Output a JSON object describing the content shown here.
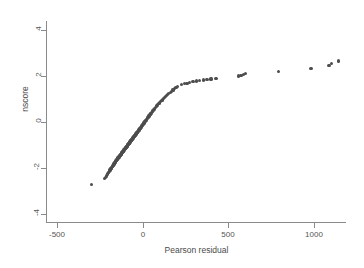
{
  "chart_data": {
    "type": "scatter",
    "title": "",
    "xlabel": "Pearson residual",
    "ylabel": "nscore",
    "xlim": [
      -560,
      1190
    ],
    "ylim": [
      -4.35,
      4.35
    ],
    "xticks": [
      -500,
      0,
      500,
      1000
    ],
    "xticklabels": [
      "-500",
      "0",
      "500",
      "1000"
    ],
    "yticks": [
      -4,
      -2,
      0,
      2,
      4
    ],
    "yticklabels": [
      "-4",
      "-2",
      "0",
      "2",
      "4"
    ],
    "grid": false,
    "legend": null,
    "marker": {
      "color": "#4d4d4d",
      "size": 3.2,
      "shape": "circle"
    },
    "series": [
      {
        "name": "nscore vs Pearson residual",
        "x": [
          -300,
          -222,
          -218,
          -214,
          -210,
          -207,
          -204,
          -201,
          -198,
          -196,
          -193,
          -191,
          -189,
          -187,
          -185,
          -183,
          -181,
          -179,
          -177,
          -175,
          -173,
          -171,
          -170,
          -168,
          -166,
          -165,
          -163,
          -162,
          -160,
          -159,
          -157,
          -156,
          -154,
          -153,
          -151,
          -150,
          -148,
          -147,
          -145,
          -144,
          -143,
          -141,
          -140,
          -139,
          -137,
          -136,
          -135,
          -133,
          -132,
          -131,
          -130,
          -128,
          -127,
          -126,
          -125,
          -123,
          -122,
          -121,
          -120,
          -119,
          -117,
          -116,
          -115,
          -114,
          -113,
          -112,
          -110,
          -109,
          -108,
          -107,
          -106,
          -105,
          -104,
          -102,
          -101,
          -100,
          -99,
          -98,
          -97,
          -96,
          -95,
          -93,
          -92,
          -91,
          -90,
          -89,
          -88,
          -87,
          -86,
          -85,
          -84,
          -82,
          -81,
          -80,
          -79,
          -78,
          -77,
          -76,
          -75,
          -74,
          -73,
          -71,
          -70,
          -69,
          -68,
          -67,
          -66,
          -65,
          -64,
          -63,
          -61,
          -60,
          -59,
          -58,
          -57,
          -56,
          -55,
          -53,
          -52,
          -51,
          -50,
          -49,
          -47,
          -46,
          -45,
          -44,
          -42,
          -41,
          -40,
          -39,
          -37,
          -36,
          -35,
          -33,
          -32,
          -31,
          -29,
          -28,
          -26,
          -25,
          -23,
          -22,
          -20,
          -19,
          -17,
          -16,
          -14,
          -12,
          -11,
          -9,
          -7,
          -6,
          -4,
          -2,
          0,
          2,
          4,
          6,
          8,
          10,
          12,
          14,
          17,
          19,
          21,
          24,
          26,
          29,
          31,
          34,
          37,
          40,
          43,
          46,
          49,
          52,
          56,
          59,
          63,
          67,
          71,
          75,
          79,
          84,
          88,
          93,
          98,
          103,
          109,
          114,
          120,
          126,
          133,
          139,
          146,
          153,
          161,
          169,
          177,
          186,
          195,
          205,
          228,
          243,
          259,
          276,
          294,
          313,
          333,
          354,
          376,
          400,
          425,
          432,
          560,
          575,
          590,
          600,
          795,
          985,
          1090,
          1105,
          1145
        ],
        "y": [
          -2.72,
          -2.47,
          -2.41,
          -2.36,
          -2.31,
          -2.27,
          -2.24,
          -2.21,
          -2.18,
          -2.15,
          -2.12,
          -2.09,
          -2.07,
          -2.04,
          -2.02,
          -2.0,
          -1.97,
          -1.95,
          -1.93,
          -1.91,
          -1.89,
          -1.87,
          -1.85,
          -1.83,
          -1.81,
          -1.8,
          -1.78,
          -1.76,
          -1.74,
          -1.73,
          -1.71,
          -1.69,
          -1.68,
          -1.66,
          -1.65,
          -1.63,
          -1.62,
          -1.6,
          -1.59,
          -1.57,
          -1.56,
          -1.54,
          -1.53,
          -1.52,
          -1.5,
          -1.49,
          -1.48,
          -1.46,
          -1.45,
          -1.44,
          -1.43,
          -1.41,
          -1.4,
          -1.39,
          -1.38,
          -1.36,
          -1.35,
          -1.34,
          -1.33,
          -1.32,
          -1.3,
          -1.29,
          -1.28,
          -1.27,
          -1.26,
          -1.25,
          -1.23,
          -1.22,
          -1.21,
          -1.2,
          -1.19,
          -1.18,
          -1.17,
          -1.15,
          -1.14,
          -1.13,
          -1.12,
          -1.11,
          -1.1,
          -1.09,
          -1.08,
          -1.06,
          -1.05,
          -1.04,
          -1.03,
          -1.02,
          -1.01,
          -1.0,
          -0.99,
          -0.98,
          -0.97,
          -0.95,
          -0.94,
          -0.93,
          -0.92,
          -0.91,
          -0.9,
          -0.89,
          -0.88,
          -0.87,
          -0.86,
          -0.84,
          -0.83,
          -0.82,
          -0.81,
          -0.8,
          -0.79,
          -0.78,
          -0.77,
          -0.76,
          -0.74,
          -0.73,
          -0.72,
          -0.71,
          -0.7,
          -0.69,
          -0.68,
          -0.66,
          -0.65,
          -0.64,
          -0.63,
          -0.62,
          -0.6,
          -0.59,
          -0.58,
          -0.57,
          -0.55,
          -0.54,
          -0.53,
          -0.52,
          -0.5,
          -0.49,
          -0.48,
          -0.46,
          -0.45,
          -0.44,
          -0.42,
          -0.41,
          -0.39,
          -0.38,
          -0.36,
          -0.35,
          -0.33,
          -0.32,
          -0.3,
          -0.28,
          -0.27,
          -0.25,
          -0.23,
          -0.22,
          -0.2,
          -0.18,
          -0.16,
          -0.14,
          -0.12,
          -0.1,
          -0.08,
          -0.06,
          -0.04,
          -0.02,
          0.0,
          0.02,
          0.05,
          0.07,
          0.1,
          0.12,
          0.15,
          0.18,
          0.2,
          0.23,
          0.26,
          0.29,
          0.32,
          0.35,
          0.38,
          0.41,
          0.45,
          0.48,
          0.52,
          0.55,
          0.59,
          0.63,
          0.67,
          0.71,
          0.75,
          0.79,
          0.83,
          0.88,
          0.92,
          0.96,
          1.01,
          1.05,
          1.1,
          1.14,
          1.19,
          1.24,
          1.29,
          1.34,
          1.39,
          1.44,
          1.49,
          1.55,
          1.62,
          1.66,
          1.69,
          1.72,
          1.75,
          1.78,
          1.81,
          1.83,
          1.85,
          1.87,
          1.89,
          1.9,
          2.0,
          2.04,
          2.07,
          2.1,
          2.21,
          2.32,
          2.45,
          2.56,
          2.65
        ]
      }
    ]
  },
  "axes": {
    "x_title": "Pearson residual",
    "y_title": "nscore"
  }
}
